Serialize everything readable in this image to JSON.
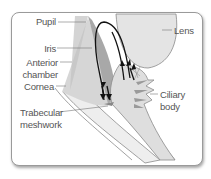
{
  "diagram": {
    "type": "anatomy",
    "labels": {
      "pupil": "Pupil",
      "lens": "Lens",
      "iris": "Iris",
      "anterior_chamber_1": "Anterior",
      "anterior_chamber_2": "chamber",
      "cornea": "Cornea",
      "trabecular_1": "Trabecular",
      "trabecular_2": "meshwork",
      "ciliary_1": "Ciliary",
      "ciliary_2": "body"
    },
    "colors": {
      "frame_border": "#9a9a9a",
      "lens_fill": "#e4e4e4",
      "iris_fill": "#a8a8a8",
      "chamber_fill": "#d4d4d4",
      "cornea_fill": "#ececec",
      "arrow": "#111111",
      "label_text": "#555555"
    }
  }
}
